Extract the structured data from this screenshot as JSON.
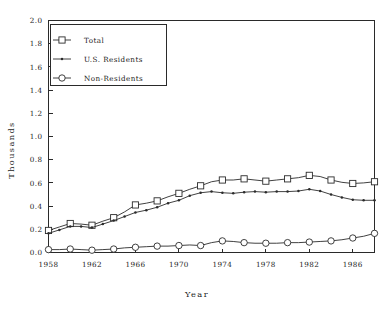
{
  "figure": {
    "background_color": "#ffffff",
    "ink_color": "#2b2b2b"
  },
  "axis_titles": {
    "x": "Year",
    "y": "Thousands"
  },
  "legend": {
    "position": "upper-left-inside",
    "entries": [
      {
        "label": "Total",
        "marker": "open-square"
      },
      {
        "label": "U.S. Residents",
        "marker": "small-cross"
      },
      {
        "label": "Non-Residents",
        "marker": "open-circle"
      }
    ]
  },
  "chart_data": {
    "type": "line",
    "title": "",
    "xlabel": "Year",
    "ylabel": "Thousands",
    "xlim": [
      1958,
      1988
    ],
    "ylim": [
      0.0,
      2.0
    ],
    "grid": false,
    "legend_position": "upper left",
    "x_tick_labels": [
      "1958",
      "1962",
      "1966",
      "1970",
      "1974",
      "1978",
      "1982",
      "1986"
    ],
    "x_ticks": [
      1958,
      1962,
      1966,
      1970,
      1974,
      1978,
      1982,
      1986
    ],
    "y_tick_labels": [
      "0.0",
      "0.2",
      "0.4",
      "0.6",
      "0.8",
      "1.0",
      "1.2",
      "1.4",
      "1.6",
      "1.8",
      "2.0"
    ],
    "y_ticks": [
      0.0,
      0.2,
      0.4,
      0.6,
      0.8,
      1.0,
      1.2,
      1.4,
      1.6,
      1.8,
      2.0
    ],
    "x": [
      1958,
      1959,
      1960,
      1961,
      1962,
      1963,
      1964,
      1965,
      1966,
      1967,
      1968,
      1969,
      1970,
      1971,
      1972,
      1973,
      1974,
      1975,
      1976,
      1977,
      1978,
      1979,
      1980,
      1981,
      1982,
      1983,
      1984,
      1985,
      1986,
      1987,
      1988
    ],
    "series": [
      {
        "name": "Total",
        "marker": "open-square",
        "marker_every": 2,
        "values": [
          0.19,
          0.22,
          0.25,
          0.245,
          0.235,
          0.27,
          0.3,
          0.35,
          0.41,
          0.425,
          0.445,
          0.48,
          0.51,
          0.545,
          0.575,
          0.61,
          0.625,
          0.625,
          0.635,
          0.625,
          0.615,
          0.625,
          0.635,
          0.645,
          0.665,
          0.655,
          0.625,
          0.605,
          0.595,
          0.6,
          0.61
        ]
      },
      {
        "name": "U.S. Residents",
        "marker": "small-cross",
        "marker_every": 2,
        "values": [
          0.165,
          0.195,
          0.225,
          0.225,
          0.215,
          0.245,
          0.275,
          0.31,
          0.345,
          0.365,
          0.39,
          0.425,
          0.45,
          0.49,
          0.515,
          0.525,
          0.515,
          0.51,
          0.52,
          0.525,
          0.52,
          0.525,
          0.525,
          0.53,
          0.545,
          0.53,
          0.5,
          0.475,
          0.455,
          0.45,
          0.45
        ]
      },
      {
        "name": "Non-Residents",
        "marker": "open-circle",
        "marker_every": 2,
        "values": [
          0.025,
          0.025,
          0.03,
          0.025,
          0.02,
          0.025,
          0.03,
          0.04,
          0.045,
          0.05,
          0.055,
          0.055,
          0.06,
          0.065,
          0.06,
          0.085,
          0.1,
          0.095,
          0.085,
          0.08,
          0.08,
          0.08,
          0.085,
          0.085,
          0.09,
          0.095,
          0.1,
          0.11,
          0.125,
          0.14,
          0.165
        ]
      }
    ]
  }
}
